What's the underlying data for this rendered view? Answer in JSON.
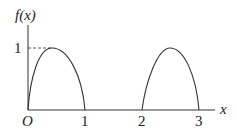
{
  "diagram": {
    "type": "function-graph",
    "y_axis_label": "f(x)",
    "x_axis_label": "x",
    "origin_label": "O",
    "y_ticks": [
      "1"
    ],
    "x_ticks": [
      "1",
      "2",
      "3"
    ],
    "curves": [
      {
        "name": "arch-1",
        "from": 0,
        "to": 1,
        "peak_x": 0.4,
        "peak_y": 1
      },
      {
        "name": "arch-2",
        "from": 2,
        "to": 3,
        "peak_x": 2.5,
        "peak_y": 1
      }
    ],
    "guide": "dashed line from y-axis at y=1 to peak of first arch",
    "colors": {
      "line": "#333333",
      "text": "#222222"
    }
  }
}
